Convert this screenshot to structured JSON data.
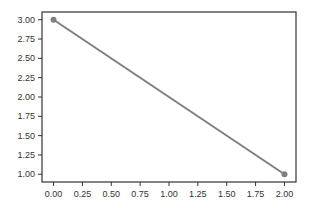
{
  "chart_data": {
    "type": "line",
    "title": "",
    "xlabel": "",
    "ylabel": "",
    "x": [
      0,
      2
    ],
    "series": [
      {
        "name": "line",
        "values": [
          3,
          1
        ],
        "color": "#7f7f7f",
        "marker": "circle"
      }
    ],
    "xlim": [
      -0.1,
      2.1
    ],
    "ylim": [
      0.9,
      3.1
    ],
    "xticks": [
      "0.00",
      "0.25",
      "0.50",
      "0.75",
      "1.00",
      "1.25",
      "1.50",
      "1.75",
      "2.00"
    ],
    "yticks": [
      "1.00",
      "1.25",
      "1.50",
      "1.75",
      "2.00",
      "2.25",
      "2.50",
      "2.75",
      "3.00"
    ],
    "grid": false,
    "legend": null
  },
  "colors": {
    "line": "#7f7f7f",
    "frame": "#333333",
    "text": "#333333"
  }
}
